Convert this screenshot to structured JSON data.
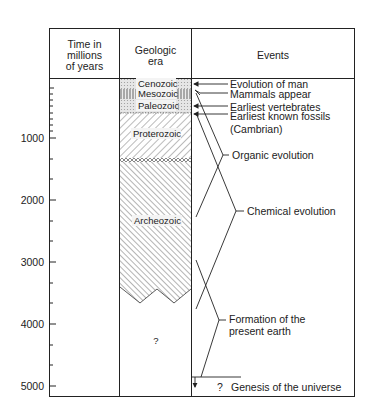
{
  "headers": {
    "time": [
      "Time in",
      "millions",
      "of years"
    ],
    "era": [
      "Geologic",
      "era"
    ],
    "events": "Events"
  },
  "axis": {
    "ticks": [
      "1000",
      "2000",
      "3000",
      "4000",
      "5000"
    ]
  },
  "eras": {
    "cenozoic": "Cenozoic",
    "mesozoic": "Mesozoic",
    "paleozoic": "Paleozoic",
    "proterozoic": "Proterozoic",
    "archeozoic": "Archeozoic",
    "unknown": "?"
  },
  "events": {
    "evolution_of_man": "Evolution of man",
    "mammals_appear": "Mammals appear",
    "earliest_vertebrates": "Earliest vertebrates",
    "earliest_fossils": "Earliest known fossils",
    "cambrian": "(Cambrian)",
    "organic_evolution": "Organic evolution",
    "chemical_evolution": "Chemical evolution",
    "formation_line1": "Formation of the",
    "formation_line2": "present earth",
    "genesis_q": "?",
    "genesis": "Genesis of the universe"
  }
}
